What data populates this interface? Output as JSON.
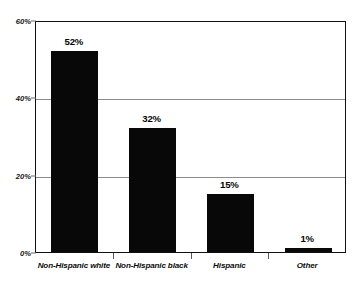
{
  "chart_data": {
    "type": "bar",
    "title": "",
    "subtitle": "",
    "xlabel": "",
    "ylabel": "",
    "categories": [
      "Non-Hispanic white",
      "Non-Hispanic black",
      "Hispanic",
      "Other"
    ],
    "values": [
      52,
      32,
      15,
      1
    ],
    "value_labels": [
      "52%",
      "32%",
      "15%",
      "1%"
    ],
    "ylim": [
      0,
      60
    ],
    "yticks": [
      0,
      20,
      40,
      60
    ],
    "ytick_labels": [
      "0%",
      "20%",
      "40%",
      "60%"
    ],
    "grid": true,
    "grid_axis": "y",
    "legend": false,
    "legend_position": "none",
    "bar_color": "#080808",
    "grid_color": "#8c8c8c",
    "axis_color": "#111111",
    "background_color": "#ffffff",
    "series": [
      {
        "name": "Share",
        "values": [
          52,
          32,
          15,
          1
        ]
      }
    ]
  }
}
